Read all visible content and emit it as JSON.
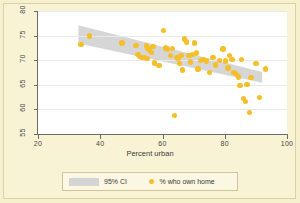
{
  "chart_data": {
    "type": "scatter",
    "title": "",
    "xlabel": "Percent urban",
    "ylabel": "",
    "xlim": [
      20,
      100
    ],
    "ylim": [
      55,
      80
    ],
    "xticks": [
      20,
      40,
      60,
      80,
      100
    ],
    "yticks": [
      55,
      60,
      65,
      70,
      75,
      80
    ],
    "grid": "horizontal",
    "legend_position": "bottom-center",
    "marker_color": "#f5bf2a",
    "band_color": "#d4d4d4",
    "background_color": "#f9f3d6",
    "plot_background_color": "#ffffff",
    "series": [
      {
        "name": "% who own home",
        "type": "scatter",
        "points": [
          [
            33.8,
            73.2
          ],
          [
            36.5,
            74.9
          ],
          [
            47.0,
            73.5
          ],
          [
            51.5,
            73.0
          ],
          [
            52.1,
            71.1
          ],
          [
            52.6,
            70.8
          ],
          [
            53.2,
            70.6
          ],
          [
            54.0,
            70.5
          ],
          [
            54.8,
            72.9
          ],
          [
            55.0,
            70.4
          ],
          [
            55.4,
            72.4
          ],
          [
            55.9,
            72.0
          ],
          [
            56.4,
            71.6
          ],
          [
            57.0,
            72.8
          ],
          [
            57.5,
            69.4
          ],
          [
            58.9,
            68.9
          ],
          [
            60.4,
            76.0
          ],
          [
            61.0,
            72.5
          ],
          [
            61.6,
            72.3
          ],
          [
            62.5,
            70.9
          ],
          [
            63.3,
            72.4
          ],
          [
            63.9,
            58.8
          ],
          [
            64.6,
            70.5
          ],
          [
            65.0,
            70.3
          ],
          [
            65.4,
            69.3
          ],
          [
            65.9,
            71.0
          ],
          [
            66.5,
            68.0
          ],
          [
            67.1,
            74.3
          ],
          [
            67.8,
            73.7
          ],
          [
            68.5,
            70.9
          ],
          [
            69.0,
            69.6
          ],
          [
            69.6,
            71.1
          ],
          [
            70.2,
            73.5
          ],
          [
            70.9,
            71.5
          ],
          [
            71.4,
            68.2
          ],
          [
            72.3,
            70.0
          ],
          [
            73.0,
            70.1
          ],
          [
            74.1,
            69.8
          ],
          [
            75.0,
            67.5
          ],
          [
            76.2,
            70.5
          ],
          [
            77.0,
            69.0
          ],
          [
            78.3,
            70.0
          ],
          [
            79.4,
            72.3
          ],
          [
            80.2,
            69.8
          ],
          [
            81.0,
            68.4
          ],
          [
            81.6,
            71.0
          ],
          [
            82.3,
            70.2
          ],
          [
            83.0,
            67.5
          ],
          [
            83.5,
            67.3
          ],
          [
            84.0,
            66.9
          ],
          [
            84.4,
            66.6
          ],
          [
            84.9,
            64.9
          ],
          [
            85.4,
            70.2
          ],
          [
            86.0,
            62.2
          ],
          [
            86.6,
            61.6
          ],
          [
            87.1,
            65.1
          ],
          [
            87.9,
            59.4
          ],
          [
            88.4,
            66.5
          ],
          [
            90.0,
            69.3
          ],
          [
            91.2,
            62.4
          ],
          [
            93.0,
            68.2
          ]
        ]
      },
      {
        "name": "95% CI",
        "type": "band",
        "x_start": 33.0,
        "x_end": 92.0,
        "upper_start": 77.1,
        "lower_start": 73.4,
        "upper_end": 67.6,
        "lower_end": 65.4
      }
    ],
    "legend": [
      {
        "label": "95% CI",
        "marker": "band",
        "color": "#d4d4d4"
      },
      {
        "label": "% who own home",
        "marker": "dot",
        "color": "#f5bf2a"
      }
    ]
  }
}
